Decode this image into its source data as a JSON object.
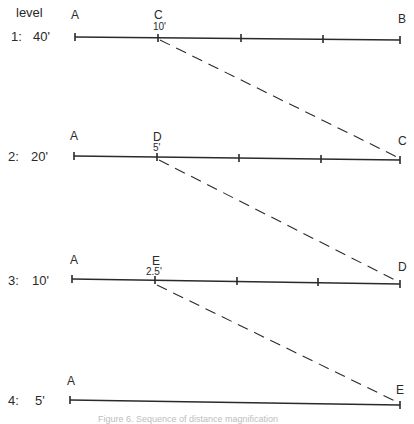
{
  "header": {
    "level_label": "level"
  },
  "levels": [
    {
      "label": "1:",
      "distance": "40'",
      "left_point": "A",
      "mid_point": "C",
      "mid_distance": "10'",
      "right_point": "B"
    },
    {
      "label": "2:",
      "distance": "20'",
      "left_point": "A",
      "mid_point": "D",
      "mid_distance": "5'",
      "right_point": "C"
    },
    {
      "label": "3:",
      "distance": "10'",
      "left_point": "A",
      "mid_point": "E",
      "mid_distance": "2.5'",
      "right_point": "D"
    },
    {
      "label": "4:",
      "distance": "5'",
      "left_point": "A",
      "right_point": "E"
    }
  ],
  "caption": "Figure 6. Sequence of distance magnification",
  "colors": {
    "line": "#2a2a2a",
    "background": "#ffffff"
  }
}
